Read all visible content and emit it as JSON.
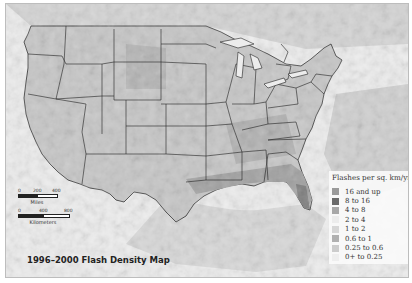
{
  "title": "1996–2000 Flash Density Map",
  "legend": {
    "title": "Flashes per sq. km/yr.",
    "items": [
      {
        "label": "16 and up",
        "color": "#9a9a9a"
      },
      {
        "label": "8 to 16",
        "color": "#6a6a6a"
      },
      {
        "label": "4 to 8",
        "color": "#a8a8a8"
      },
      {
        "label": "2 to 4",
        "color": "#ececec"
      },
      {
        "label": "1 to 2",
        "color": "#d6d6d6"
      },
      {
        "label": "0.6 to 1",
        "color": "#b0b0b0"
      },
      {
        "label": "0.25 to 0.6",
        "color": "#cccccc"
      },
      {
        "label": "0+ to 0.25",
        "color": "#eeeeee"
      }
    ]
  },
  "scale": {
    "miles": {
      "unit": "Miles",
      "ticks": [
        "0",
        "200",
        "400"
      ]
    },
    "kilometers": {
      "unit": "Kilometers",
      "ticks": [
        "0",
        "400",
        "800"
      ]
    }
  },
  "colors": {
    "land_light": "#dcdcdc",
    "land_mid": "#c2c2c2",
    "land_dark": "#a6a6a6",
    "land_darkest": "#7a7a7a",
    "water": "#f2f2f2",
    "border": "#222222"
  }
}
